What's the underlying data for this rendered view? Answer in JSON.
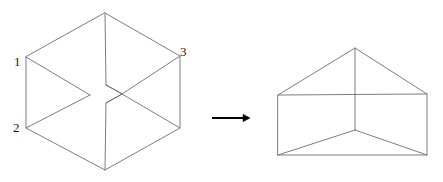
{
  "figure": {
    "canvas": {
      "width": 443,
      "height": 182,
      "background": "#ffffff"
    },
    "stroke": {
      "line_color": "#6e6e6e",
      "line_width": 0.9,
      "arrow_color": "#000000"
    },
    "labels": {
      "vertex_1": "1",
      "vertex_2": "2",
      "vertex_3": "3"
    },
    "left_shape": {
      "name": "necker-cube",
      "description": "Hexagonal outline isometric cube with ambiguous center junction",
      "outer_hexagon": [
        [
          105,
          13
        ],
        [
          180,
          56
        ],
        [
          180,
          128
        ],
        [
          105,
          170
        ],
        [
          26,
          128
        ],
        [
          26,
          57
        ]
      ],
      "interior_segments": [
        [
          [
            105,
            13
          ],
          [
            106,
            85
          ]
        ],
        [
          [
            26,
            57
          ],
          [
            90,
            95
          ]
        ],
        [
          [
            180,
            56
          ],
          [
            122,
            94
          ]
        ],
        [
          [
            106,
            103
          ],
          [
            105,
            170
          ]
        ],
        [
          [
            26,
            128
          ],
          [
            90,
            95
          ]
        ],
        [
          [
            180,
            128
          ],
          [
            122,
            94
          ]
        ],
        [
          [
            106,
            85
          ],
          [
            90,
            95
          ]
        ],
        [
          [
            106,
            85
          ],
          [
            122,
            94
          ]
        ],
        [
          [
            106,
            103
          ],
          [
            90,
            95
          ]
        ],
        [
          [
            106,
            103
          ],
          [
            122,
            94
          ]
        ]
      ]
    },
    "arrow": {
      "name": "rightwards-arrow",
      "from": [
        212,
        118
      ],
      "to": [
        250,
        118
      ],
      "head_size": 7
    },
    "right_shape": {
      "name": "wedge-prism",
      "description": "Triangular prism / wedge wireframe",
      "outline": [
        [
          278,
          95
        ],
        [
          355,
          48
        ],
        [
          427,
          94
        ],
        [
          427,
          155
        ],
        [
          278,
          155
        ]
      ],
      "interior_segments": [
        [
          [
            278,
            95
          ],
          [
            427,
            94
          ]
        ],
        [
          [
            355,
            48
          ],
          [
            355,
            130
          ]
        ],
        [
          [
            355,
            130
          ],
          [
            278,
            155
          ]
        ],
        [
          [
            355,
            130
          ],
          [
            427,
            155
          ]
        ]
      ]
    }
  },
  "chart_data": {
    "type": "diagram",
    "xlabel": "",
    "ylabel": "",
    "annotations": [
      "1",
      "2",
      "3"
    ],
    "series": [
      {
        "name": "left-figure-necker-cube",
        "vertices": [
          [
            105,
            13
          ],
          [
            180,
            56
          ],
          [
            180,
            128
          ],
          [
            105,
            170
          ],
          [
            26,
            128
          ],
          [
            26,
            57
          ],
          [
            106,
            85
          ],
          [
            106,
            103
          ],
          [
            90,
            95
          ],
          [
            122,
            94
          ]
        ]
      },
      {
        "name": "right-figure-wedge-prism",
        "vertices": [
          [
            278,
            95
          ],
          [
            355,
            48
          ],
          [
            427,
            94
          ],
          [
            427,
            155
          ],
          [
            278,
            155
          ],
          [
            355,
            130
          ]
        ]
      }
    ]
  }
}
